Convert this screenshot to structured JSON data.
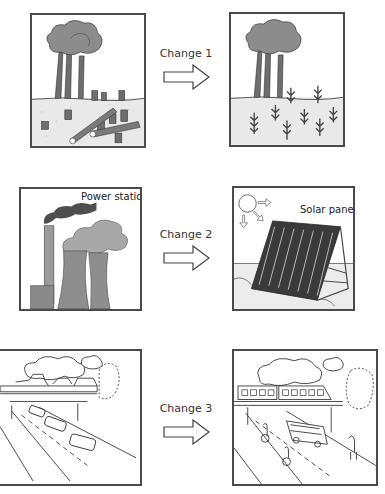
{
  "rows": [
    {
      "change_label": "Change 1",
      "before": {
        "title": "Deforested land with tree stumps and felled logs",
        "caption": ""
      },
      "after": {
        "title": "Reforested land with young saplings",
        "caption": ""
      }
    },
    {
      "change_label": "Change 2",
      "before": {
        "title": "Power station with cooling towers and smoke",
        "caption": "Power station"
      },
      "after": {
        "title": "Solar panel absorbing sunlight",
        "caption": "Solar panel"
      }
    },
    {
      "change_label": "Change 3",
      "before": {
        "title": "Highway with cars under overpass",
        "caption": ""
      },
      "after": {
        "title": "Road with bus, cyclists, pedestrian and train on bridge",
        "caption": ""
      }
    }
  ],
  "colors": {
    "border": "#4a4a4a",
    "foliage": "#8c8c8c",
    "trunk": "#6e6e6e",
    "ground": "#e6e6e6",
    "smoke_dark": "#555555",
    "cloud": "#a8a8a8",
    "tower": "#8e8e8e",
    "panel_dark": "#3a3a3a"
  }
}
